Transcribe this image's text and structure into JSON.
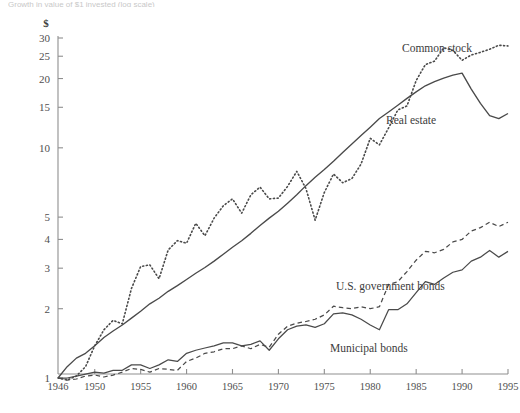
{
  "caption_partial": "Growth in value of $1 invested (log scale)",
  "axis": {
    "y_unit": "$",
    "y_ticks": [
      1,
      2,
      3,
      4,
      5,
      10,
      15,
      20,
      25,
      30
    ],
    "y_scale": "log",
    "y_min": 0.92,
    "y_max": 31.5,
    "x_ticks": [
      1946,
      1950,
      1955,
      1960,
      1965,
      1970,
      1975,
      1980,
      1985,
      1990,
      1995
    ],
    "x_min": 1946,
    "x_max": 1995
  },
  "labels": {
    "common_stock": "Common stock",
    "real_estate": "Real estate",
    "us_government_bonds": "U.S. government bonds",
    "municipal_bonds": "Municipal bonds"
  },
  "colors": {
    "ink": "#4a4a4a",
    "axis": "#8f8f8f",
    "background": "#ffffff"
  },
  "chart_data": {
    "type": "line",
    "title": "Growth in value of $1 invested (log scale)",
    "xlabel": "",
    "ylabel": "$",
    "yscale": "log",
    "ylim": [
      0.92,
      31.5
    ],
    "xlim": [
      1946,
      1995
    ],
    "grid": false,
    "legend": "inline-labels",
    "x": [
      1946,
      1947,
      1948,
      1949,
      1950,
      1951,
      1952,
      1953,
      1954,
      1955,
      1956,
      1957,
      1958,
      1959,
      1960,
      1961,
      1962,
      1963,
      1964,
      1965,
      1966,
      1967,
      1968,
      1969,
      1970,
      1971,
      1972,
      1973,
      1974,
      1975,
      1976,
      1977,
      1978,
      1979,
      1980,
      1981,
      1982,
      1983,
      1984,
      1985,
      1986,
      1987,
      1988,
      1989,
      1990,
      1991,
      1992,
      1993,
      1994,
      1995
    ],
    "series": [
      {
        "name": "Common stock",
        "style": "dotted",
        "values": [
          1.0,
          0.98,
          1.02,
          1.12,
          1.38,
          1.62,
          1.78,
          1.72,
          2.45,
          3.05,
          3.1,
          2.7,
          3.6,
          3.95,
          3.85,
          4.7,
          4.15,
          4.95,
          5.6,
          6.0,
          5.2,
          6.25,
          6.75,
          6.0,
          6.05,
          6.8,
          7.9,
          6.65,
          4.85,
          6.4,
          7.7,
          7.05,
          7.35,
          8.5,
          11.0,
          10.3,
          12.2,
          14.6,
          15.2,
          19.6,
          23.0,
          23.8,
          27.2,
          26.5,
          24.0,
          25.3,
          26.0,
          26.8,
          27.9,
          27.7
        ]
      },
      {
        "name": "Real estate",
        "style": "solid",
        "values": [
          1.0,
          1.12,
          1.22,
          1.28,
          1.38,
          1.5,
          1.6,
          1.7,
          1.82,
          1.95,
          2.1,
          2.22,
          2.38,
          2.52,
          2.68,
          2.85,
          3.02,
          3.22,
          3.45,
          3.7,
          3.95,
          4.25,
          4.6,
          4.95,
          5.3,
          5.75,
          6.25,
          6.85,
          7.45,
          8.05,
          8.75,
          9.55,
          10.4,
          11.3,
          12.3,
          13.4,
          14.3,
          15.3,
          16.4,
          17.5,
          18.6,
          19.4,
          20.1,
          20.7,
          21.1,
          18.0,
          15.6,
          13.8,
          13.4,
          14.1
        ]
      },
      {
        "name": "U.S. government bonds",
        "style": "dashed",
        "values": [
          1.0,
          0.98,
          0.99,
          1.02,
          1.03,
          1.01,
          1.03,
          1.06,
          1.1,
          1.09,
          1.06,
          1.1,
          1.09,
          1.08,
          1.18,
          1.22,
          1.28,
          1.3,
          1.34,
          1.34,
          1.38,
          1.34,
          1.4,
          1.36,
          1.55,
          1.68,
          1.73,
          1.76,
          1.8,
          1.88,
          2.05,
          2.02,
          2.0,
          2.04,
          2.0,
          2.04,
          2.55,
          2.62,
          2.9,
          3.25,
          3.55,
          3.5,
          3.62,
          3.9,
          4.0,
          4.35,
          4.5,
          4.75,
          4.55,
          4.75
        ]
      },
      {
        "name": "Municipal bonds",
        "style": "solid-thin",
        "values": [
          1.0,
          1.0,
          1.02,
          1.04,
          1.06,
          1.05,
          1.08,
          1.08,
          1.14,
          1.14,
          1.1,
          1.14,
          1.2,
          1.18,
          1.28,
          1.32,
          1.35,
          1.38,
          1.42,
          1.42,
          1.38,
          1.4,
          1.45,
          1.32,
          1.48,
          1.62,
          1.68,
          1.7,
          1.66,
          1.72,
          1.9,
          1.92,
          1.88,
          1.8,
          1.7,
          1.62,
          1.98,
          1.98,
          2.1,
          2.35,
          2.62,
          2.55,
          2.72,
          2.88,
          2.95,
          3.22,
          3.35,
          3.58,
          3.35,
          3.55
        ]
      }
    ]
  }
}
